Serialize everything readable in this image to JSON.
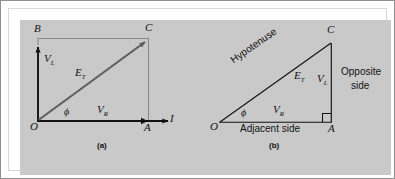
{
  "figure": {
    "background_color": "#c9c9c9",
    "frame_color": "#8f8f8f",
    "ink_color": "#111111",
    "light_line_color": "#8a8a8a"
  },
  "panel_a": {
    "caption": "(a)",
    "points": {
      "origin": "O",
      "top_left": "B",
      "top_right": "C",
      "bottom_right": "A"
    },
    "axis_labels": {
      "current": "I"
    },
    "vectors": [
      {
        "name": "vertical-voltage",
        "symbol": "V",
        "subscript": "L"
      },
      {
        "name": "resultant-voltage",
        "symbol": "E",
        "subscript": "T"
      },
      {
        "name": "horizontal-voltage",
        "symbol": "V",
        "subscript": "R"
      }
    ],
    "angle_label": "ϕ"
  },
  "panel_b": {
    "caption": "(b)",
    "points": {
      "origin": "O",
      "apex": "C",
      "right_angle": "A"
    },
    "side_names": {
      "hypotenuse": "Hypotenuse",
      "adjacent": "Adjacent side",
      "opposite_line_1": "Opposite",
      "opposite_line_2": "side"
    },
    "vectors": [
      {
        "name": "hypotenuse-magnitude",
        "symbol": "E",
        "subscript": "T"
      },
      {
        "name": "opposite-magnitude",
        "symbol": "V",
        "subscript": "L"
      },
      {
        "name": "adjacent-magnitude",
        "symbol": "V",
        "subscript": "R"
      }
    ],
    "angle_label": "ϕ"
  }
}
